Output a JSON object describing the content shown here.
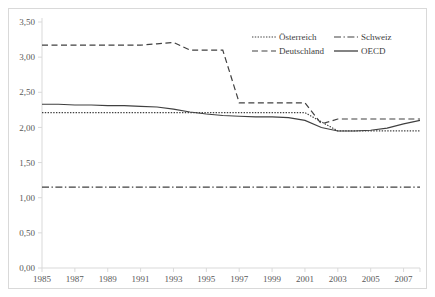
{
  "chart_data": {
    "type": "line",
    "title": "",
    "xlabel": "",
    "ylabel": "",
    "xlim": [
      1985,
      2008
    ],
    "ylim": [
      0.0,
      3.5
    ],
    "grid": false,
    "legend_position": "top-right",
    "y_ticks": [
      "0,00",
      "0,50",
      "1,00",
      "1,50",
      "2,00",
      "2,50",
      "3,00",
      "3,50"
    ],
    "y_tick_values": [
      0.0,
      0.5,
      1.0,
      1.5,
      2.0,
      2.5,
      3.0,
      3.5
    ],
    "x_ticks": [
      "1985",
      "1987",
      "1989",
      "1991",
      "1993",
      "1995",
      "1997",
      "1999",
      "2001",
      "2003",
      "2005",
      "2007"
    ],
    "x_tick_values": [
      1985,
      1987,
      1989,
      1991,
      1993,
      1995,
      1997,
      1999,
      2001,
      2003,
      2005,
      2007
    ],
    "x": [
      1985,
      1986,
      1987,
      1988,
      1989,
      1990,
      1991,
      1992,
      1993,
      1994,
      1995,
      1996,
      1997,
      1998,
      1999,
      2000,
      2001,
      2002,
      2003,
      2004,
      2005,
      2006,
      2007,
      2008
    ],
    "series": [
      {
        "name": "Österreich",
        "style": "dotted",
        "color": "#404040",
        "values": [
          2.21,
          2.21,
          2.21,
          2.21,
          2.21,
          2.21,
          2.21,
          2.21,
          2.21,
          2.21,
          2.21,
          2.21,
          2.21,
          2.21,
          2.21,
          2.21,
          2.21,
          2.08,
          1.95,
          1.95,
          1.95,
          1.95,
          1.95,
          1.95
        ]
      },
      {
        "name": "Schweiz",
        "style": "dash-dot",
        "color": "#404040",
        "values": [
          1.15,
          1.15,
          1.15,
          1.15,
          1.15,
          1.15,
          1.15,
          1.15,
          1.15,
          1.15,
          1.15,
          1.15,
          1.15,
          1.15,
          1.15,
          1.15,
          1.15,
          1.15,
          1.15,
          1.15,
          1.15,
          1.15,
          1.15,
          1.15
        ]
      },
      {
        "name": "Deutschland",
        "style": "dashed",
        "color": "#404040",
        "values": [
          3.17,
          3.17,
          3.17,
          3.17,
          3.17,
          3.17,
          3.17,
          3.19,
          3.21,
          3.1,
          3.1,
          3.1,
          2.35,
          2.35,
          2.35,
          2.35,
          2.35,
          2.05,
          2.12,
          2.12,
          2.12,
          2.12,
          2.12,
          2.12
        ]
      },
      {
        "name": "OECD",
        "style": "solid",
        "color": "#404040",
        "values": [
          2.33,
          2.33,
          2.32,
          2.32,
          2.31,
          2.31,
          2.3,
          2.29,
          2.26,
          2.22,
          2.19,
          2.17,
          2.16,
          2.15,
          2.15,
          2.14,
          2.1,
          2.0,
          1.95,
          1.95,
          1.96,
          1.99,
          2.05,
          2.1
        ]
      }
    ],
    "legend": [
      {
        "label": "Österreich",
        "style": "dotted"
      },
      {
        "label": "Schweiz",
        "style": "dash-dot"
      },
      {
        "label": "Deutschland",
        "style": "dashed"
      },
      {
        "label": "OECD",
        "style": "solid"
      }
    ]
  }
}
